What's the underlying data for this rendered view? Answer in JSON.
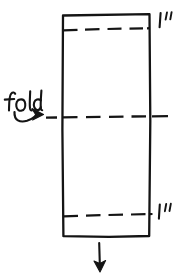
{
  "figure": {
    "kind": "hand-drawn-sketch",
    "stroke_color": "#141414",
    "background_color": "#ffffff"
  },
  "shapes": {
    "paper_rectangle": {
      "name": "paper-strip",
      "x": 62,
      "y": 14,
      "width": 88,
      "height": 223
    },
    "top_dashed_line": {
      "name": "top-margin-line",
      "y": 29,
      "x1": 62,
      "x2": 150,
      "style": "dashed"
    },
    "bottom_dashed_line": {
      "name": "bottom-margin-line",
      "y": 215,
      "x1": 62,
      "x2": 150,
      "style": "dashed"
    },
    "fold_line": {
      "name": "center-fold-line",
      "y": 117,
      "x1": 45,
      "x2": 168,
      "style": "dashed"
    },
    "down_arrow": {
      "name": "direction-arrow",
      "x": 99,
      "y1": 243,
      "y2": 270,
      "direction": "down"
    },
    "curved_arrow": {
      "name": "fold-callout-arrow",
      "direction": "right"
    }
  },
  "labels": {
    "top_dimension": "1\"",
    "bottom_dimension": "1\"",
    "fold": "fold"
  }
}
